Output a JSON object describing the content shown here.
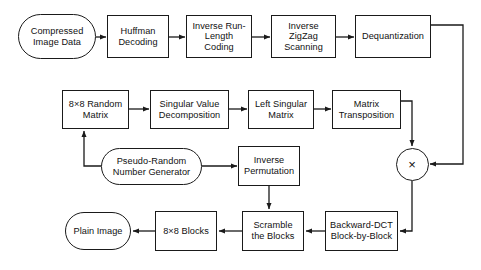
{
  "diagram": {
    "stroke_color": "#1a1a1a",
    "text_color": "#111111",
    "background": "#ffffff",
    "nodes": [
      {
        "id": "compressed_image_data",
        "label": "Compressed\nImage Data",
        "shape": "rounded",
        "x": 18,
        "y": 14,
        "w": 78,
        "h": 45
      },
      {
        "id": "huffman_decoding",
        "label": "Huffman\nDecoding",
        "shape": "rect",
        "x": 107,
        "y": 15,
        "w": 62,
        "h": 43
      },
      {
        "id": "inverse_run_length_coding",
        "label": "Inverse Run-\nLength\nCoding",
        "shape": "rect",
        "x": 186,
        "y": 15,
        "w": 66,
        "h": 43
      },
      {
        "id": "inverse_zigzag_scanning",
        "label": "Inverse\nZigZag\nScanning",
        "shape": "rect",
        "x": 271,
        "y": 15,
        "w": 65,
        "h": 43
      },
      {
        "id": "dequantization",
        "label": "Dequantization",
        "shape": "rect",
        "x": 355,
        "y": 15,
        "w": 76,
        "h": 43
      },
      {
        "id": "random_matrix_8x8",
        "label": "8×8 Random\nMatrix",
        "shape": "rect",
        "x": 62,
        "y": 90,
        "w": 67,
        "h": 39
      },
      {
        "id": "singular_value_decomposition",
        "label": "Singular Value\nDecomposition",
        "shape": "rect",
        "x": 150,
        "y": 90,
        "w": 79,
        "h": 39
      },
      {
        "id": "left_singular_matrix",
        "label": "Left Singular\nMatrix",
        "shape": "rect",
        "x": 248,
        "y": 90,
        "w": 66,
        "h": 39
      },
      {
        "id": "matrix_transposition",
        "label": "Matrix\nTransposition",
        "shape": "rect",
        "x": 332,
        "y": 90,
        "w": 69,
        "h": 39
      },
      {
        "id": "pseudo_random_number_generator",
        "label": "Pseudo-Random\nNumber Generator",
        "shape": "rounded",
        "x": 101,
        "y": 148,
        "w": 101,
        "h": 37
      },
      {
        "id": "inverse_permutation",
        "label": "Inverse\nPermutation",
        "shape": "rect",
        "x": 238,
        "y": 146,
        "w": 62,
        "h": 40
      },
      {
        "id": "plain_image",
        "label": "Plain Image",
        "shape": "rounded",
        "x": 65,
        "y": 212,
        "w": 66,
        "h": 38
      },
      {
        "id": "blocks_8x8",
        "label": "8×8 Blocks",
        "shape": "rect",
        "x": 155,
        "y": 211,
        "w": 62,
        "h": 40
      },
      {
        "id": "scramble_the_blocks",
        "label": "Scramble\nthe Blocks",
        "shape": "rect",
        "x": 242,
        "y": 211,
        "w": 62,
        "h": 40
      },
      {
        "id": "backward_dct_block_by_block",
        "label": "Backward-DCT\nBlock-by-Block",
        "shape": "rect",
        "x": 325,
        "y": 211,
        "w": 73,
        "h": 40
      }
    ],
    "operators": [
      {
        "id": "multiply_operator",
        "label": "×",
        "shape": "circle",
        "cx": 412,
        "cy": 164,
        "r": 16.5
      }
    ],
    "edges": [
      {
        "from": "compressed_image_data",
        "to": "huffman_decoding"
      },
      {
        "from": "huffman_decoding",
        "to": "inverse_run_length_coding"
      },
      {
        "from": "inverse_run_length_coding",
        "to": "inverse_zigzag_scanning"
      },
      {
        "from": "inverse_zigzag_scanning",
        "to": "dequantization"
      },
      {
        "from": "dequantization",
        "to": "multiply_operator"
      },
      {
        "from": "random_matrix_8x8",
        "to": "singular_value_decomposition"
      },
      {
        "from": "singular_value_decomposition",
        "to": "left_singular_matrix"
      },
      {
        "from": "left_singular_matrix",
        "to": "matrix_transposition"
      },
      {
        "from": "matrix_transposition",
        "to": "multiply_operator"
      },
      {
        "from": "pseudo_random_number_generator",
        "to": "random_matrix_8x8"
      },
      {
        "from": "pseudo_random_number_generator",
        "to": "inverse_permutation"
      },
      {
        "from": "inverse_permutation",
        "to": "scramble_the_blocks"
      },
      {
        "from": "multiply_operator",
        "to": "backward_dct_block_by_block"
      },
      {
        "from": "backward_dct_block_by_block",
        "to": "scramble_the_blocks"
      },
      {
        "from": "scramble_the_blocks",
        "to": "blocks_8x8"
      },
      {
        "from": "blocks_8x8",
        "to": "plain_image"
      }
    ]
  }
}
